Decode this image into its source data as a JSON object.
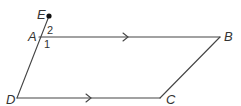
{
  "diagram": {
    "type": "parallelogram",
    "stroke_color": "#444444",
    "text_color": "#333333",
    "points": {
      "E": {
        "label": "E",
        "x": 49,
        "y": 16
      },
      "A": {
        "label": "A",
        "x": 37,
        "y": 37
      },
      "B": {
        "label": "B",
        "x": 220,
        "y": 37
      },
      "C": {
        "label": "C",
        "x": 160,
        "y": 98
      },
      "D": {
        "label": "D",
        "x": 17,
        "y": 98
      }
    },
    "angles": [
      {
        "label": "2",
        "at": "A",
        "position": "between AE and AB"
      },
      {
        "label": "1",
        "at": "A",
        "position": "between AB and AD"
      }
    ],
    "parallel_marks": [
      {
        "segment": "AB",
        "direction": "right"
      },
      {
        "segment": "DC",
        "direction": "right"
      }
    ]
  }
}
